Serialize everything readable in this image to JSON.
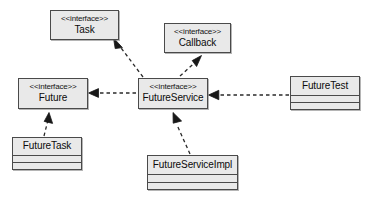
{
  "diagram": {
    "type": "uml-class-diagram",
    "background_color": "#ffffff",
    "node_fill_color": "#e9e9e9",
    "node_border_color": "#4a4a4a",
    "edge_color": "#2a2a2a",
    "stereotype_label": "<<interface>>",
    "nodes": [
      {
        "id": "task",
        "name": "Task",
        "kind": "interface",
        "stereotype": "<<interface>>",
        "compartments": 0,
        "x": 50,
        "y": 10,
        "w": 69,
        "h": 30
      },
      {
        "id": "callback",
        "name": "Callback",
        "kind": "interface",
        "stereotype": "<<interface>>",
        "compartments": 0,
        "x": 164,
        "y": 23,
        "w": 67,
        "h": 30
      },
      {
        "id": "future",
        "name": "Future",
        "kind": "interface",
        "stereotype": "<<interface>>",
        "compartments": 0,
        "x": 18,
        "y": 78,
        "w": 70,
        "h": 31
      },
      {
        "id": "futureservice",
        "name": "FutureService",
        "kind": "interface",
        "stereotype": "<<interface>>",
        "compartments": 0,
        "x": 138,
        "y": 78,
        "w": 70,
        "h": 31
      },
      {
        "id": "futuretest",
        "name": "FutureTest",
        "kind": "class",
        "stereotype": "",
        "compartments": 2,
        "x": 290,
        "y": 76,
        "w": 70,
        "h": 34
      },
      {
        "id": "futuretask",
        "name": "FutureTask",
        "kind": "class",
        "stereotype": "",
        "compartments": 2,
        "x": 12,
        "y": 137,
        "w": 70,
        "h": 33
      },
      {
        "id": "futureserviceimpl",
        "name": "FutureServiceImpl",
        "kind": "class",
        "stereotype": "",
        "compartments": 2,
        "x": 147,
        "y": 155,
        "w": 91,
        "h": 35
      }
    ],
    "edges": [
      {
        "id": "futureservice-realizes-task",
        "from": "futureservice",
        "to": "task",
        "relation": "realization",
        "line_style": "dashed",
        "arrowhead": "closed-triangle"
      },
      {
        "id": "futureservice-realizes-callback",
        "from": "futureservice",
        "to": "callback",
        "relation": "realization",
        "line_style": "dashed",
        "arrowhead": "closed-triangle"
      },
      {
        "id": "futureservice-depends-future",
        "from": "futureservice",
        "to": "future",
        "relation": "dependency",
        "line_style": "dashed",
        "arrowhead": "closed-triangle"
      },
      {
        "id": "futuretest-depends-futureservice",
        "from": "futuretest",
        "to": "futureservice",
        "relation": "dependency",
        "line_style": "dashed",
        "arrowhead": "closed-triangle"
      },
      {
        "id": "futuretask-realizes-future",
        "from": "futuretask",
        "to": "future",
        "relation": "realization",
        "line_style": "dashed",
        "arrowhead": "closed-triangle"
      },
      {
        "id": "futureserviceimpl-realizes-futureservice",
        "from": "futureserviceimpl",
        "to": "futureservice",
        "relation": "realization",
        "line_style": "dashed",
        "arrowhead": "closed-triangle"
      }
    ]
  }
}
